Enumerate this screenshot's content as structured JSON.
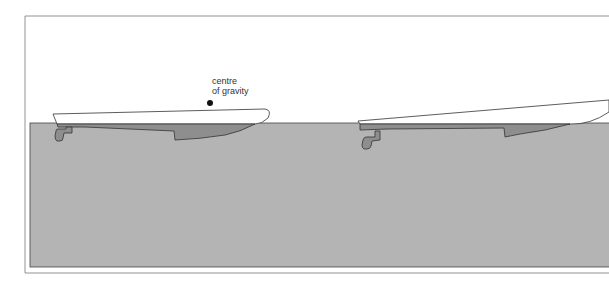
{
  "diagram": {
    "label_line1": "centre",
    "label_line2": "of gravity",
    "colors": {
      "water": "#b4b4b4",
      "hull_submerged": "#8e8e8e",
      "outline": "#333333",
      "frame": "#666666",
      "background": "#ffffff"
    }
  }
}
